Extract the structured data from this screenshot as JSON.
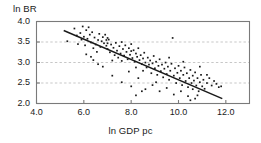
{
  "chart_data": {
    "type": "scatter",
    "title": "",
    "xlabel": "ln GDP pc",
    "ylabel": "ln BR",
    "xlim": [
      4.0,
      13.0
    ],
    "ylim": [
      2.0,
      4.0
    ],
    "xticks": [
      "4.0",
      "6.0",
      "8.0",
      "10.0",
      "12.0"
    ],
    "xtick_values": [
      4.0,
      6.0,
      8.0,
      10.0,
      12.0
    ],
    "yticks": [
      "4.0",
      "3.5",
      "3.0",
      "2.5",
      "2.0"
    ],
    "ytick_values": [
      4.0,
      3.5,
      3.0,
      2.5,
      2.0
    ],
    "grid": "horizontal-dashed",
    "gridlines_y": [
      3.5,
      3.0,
      2.5
    ],
    "legend": "none",
    "marker_color": "#1a1a1a",
    "line_color": "#1a1a1a",
    "frame_color": "#7a7a7a",
    "grid_color": "#b9b9b9",
    "trendline": {
      "label": "linear fit",
      "x_start": 5.15,
      "y_start": 3.78,
      "x_end": 11.85,
      "y_end": 2.12
    },
    "points": [
      [
        5.3,
        3.52
      ],
      [
        5.6,
        3.83
      ],
      [
        5.7,
        3.66
      ],
      [
        5.75,
        3.45
      ],
      [
        5.85,
        3.72
      ],
      [
        5.9,
        3.56
      ],
      [
        5.95,
        3.88
      ],
      [
        6.0,
        3.63
      ],
      [
        6.05,
        3.42
      ],
      [
        6.1,
        3.79
      ],
      [
        6.15,
        3.58
      ],
      [
        6.2,
        3.86
      ],
      [
        6.25,
        3.68
      ],
      [
        6.3,
        3.49
      ],
      [
        6.35,
        3.74
      ],
      [
        6.4,
        3.35
      ],
      [
        6.45,
        3.61
      ],
      [
        6.5,
        3.44
      ],
      [
        6.55,
        3.26
      ],
      [
        6.6,
        3.55
      ],
      [
        6.65,
        3.7
      ],
      [
        6.7,
        3.38
      ],
      [
        6.75,
        3.52
      ],
      [
        6.8,
        3.62
      ],
      [
        6.85,
        3.47
      ],
      [
        6.9,
        3.68
      ],
      [
        6.95,
        3.55
      ],
      [
        6.95,
        3.41
      ],
      [
        7.0,
        3.6
      ],
      [
        7.0,
        3.47
      ],
      [
        7.0,
        3.33
      ],
      [
        7.05,
        3.56
      ],
      [
        7.1,
        3.25
      ],
      [
        7.15,
        3.44
      ],
      [
        7.2,
        3.05
      ],
      [
        7.25,
        3.36
      ],
      [
        7.3,
        3.18
      ],
      [
        7.35,
        3.48
      ],
      [
        7.4,
        3.29
      ],
      [
        7.45,
        3.12
      ],
      [
        7.5,
        3.4
      ],
      [
        7.55,
        3.22
      ],
      [
        7.6,
        3.5
      ],
      [
        7.6,
        3.04
      ],
      [
        7.65,
        3.33
      ],
      [
        7.7,
        3.17
      ],
      [
        7.75,
        3.42
      ],
      [
        7.8,
        3.26
      ],
      [
        7.85,
        3.08
      ],
      [
        7.9,
        3.35
      ],
      [
        7.95,
        3.19
      ],
      [
        8.0,
        3.45
      ],
      [
        8.0,
        3.28
      ],
      [
        8.05,
        3.11
      ],
      [
        8.1,
        3.3
      ],
      [
        8.15,
        3.02
      ],
      [
        8.2,
        3.22
      ],
      [
        8.2,
        2.88
      ],
      [
        8.25,
        3.14
      ],
      [
        8.3,
        3.35
      ],
      [
        8.35,
        3.06
      ],
      [
        8.4,
        3.18
      ],
      [
        8.45,
        2.96
      ],
      [
        8.5,
        3.1
      ],
      [
        8.5,
        2.8
      ],
      [
        8.55,
        3.24
      ],
      [
        8.6,
        3.0
      ],
      [
        8.65,
        2.88
      ],
      [
        8.7,
        3.12
      ],
      [
        8.75,
        2.95
      ],
      [
        8.8,
        3.05
      ],
      [
        8.85,
        2.74
      ],
      [
        8.9,
        2.98
      ],
      [
        8.95,
        3.16
      ],
      [
        9.0,
        2.86
      ],
      [
        9.05,
        3.02
      ],
      [
        9.1,
        2.7
      ],
      [
        9.15,
        2.92
      ],
      [
        9.2,
        3.08
      ],
      [
        9.25,
        2.79
      ],
      [
        9.3,
        2.95
      ],
      [
        9.35,
        2.64
      ],
      [
        9.4,
        2.85
      ],
      [
        9.45,
        3.0
      ],
      [
        9.5,
        2.72
      ],
      [
        9.55,
        2.9
      ],
      [
        9.6,
        2.58
      ],
      [
        9.65,
        2.8
      ],
      [
        9.7,
        2.97
      ],
      [
        9.75,
        3.6
      ],
      [
        9.8,
        2.68
      ],
      [
        9.85,
        2.86
      ],
      [
        9.9,
        2.5
      ],
      [
        9.95,
        2.75
      ],
      [
        10.0,
        2.92
      ],
      [
        10.05,
        2.62
      ],
      [
        10.1,
        2.8
      ],
      [
        10.15,
        2.45
      ],
      [
        10.2,
        2.7
      ],
      [
        10.25,
        2.88
      ],
      [
        10.3,
        2.55
      ],
      [
        10.35,
        2.74
      ],
      [
        10.4,
        2.4
      ],
      [
        10.45,
        2.62
      ],
      [
        10.5,
        2.82
      ],
      [
        10.55,
        2.5
      ],
      [
        10.6,
        2.68
      ],
      [
        10.6,
        2.35
      ],
      [
        10.65,
        2.56
      ],
      [
        10.7,
        2.76
      ],
      [
        10.75,
        2.44
      ],
      [
        10.8,
        2.62
      ],
      [
        10.85,
        2.3
      ],
      [
        10.9,
        2.52
      ],
      [
        10.95,
        2.7
      ],
      [
        11.0,
        2.42
      ],
      [
        11.05,
        2.58
      ],
      [
        11.1,
        2.36
      ],
      [
        11.2,
        2.5
      ],
      [
        11.3,
        2.62
      ],
      [
        11.4,
        2.44
      ],
      [
        11.5,
        2.55
      ],
      [
        11.6,
        2.48
      ],
      [
        11.7,
        2.4
      ],
      [
        11.8,
        2.42
      ],
      [
        6.1,
        3.2
      ],
      [
        6.4,
        3.06
      ],
      [
        6.8,
        2.9
      ],
      [
        7.2,
        2.68
      ],
      [
        7.6,
        2.52
      ],
      [
        8.0,
        2.42
      ],
      [
        8.3,
        2.62
      ],
      [
        8.6,
        2.35
      ],
      [
        8.9,
        2.45
      ],
      [
        9.2,
        2.3
      ],
      [
        9.5,
        2.38
      ],
      [
        9.8,
        2.22
      ],
      [
        10.1,
        2.3
      ],
      [
        10.4,
        2.18
      ],
      [
        10.7,
        2.12
      ],
      [
        10.5,
        2.08
      ],
      [
        10.8,
        2.2
      ],
      [
        8.2,
        2.2
      ],
      [
        8.45,
        2.3
      ],
      [
        7.9,
        2.78
      ],
      [
        6.6,
        2.96
      ],
      [
        6.3,
        3.14
      ],
      [
        9.05,
        2.52
      ],
      [
        9.6,
        3.12
      ],
      [
        10.2,
        3.02
      ],
      [
        10.9,
        2.9
      ],
      [
        11.2,
        2.7
      ]
    ]
  }
}
